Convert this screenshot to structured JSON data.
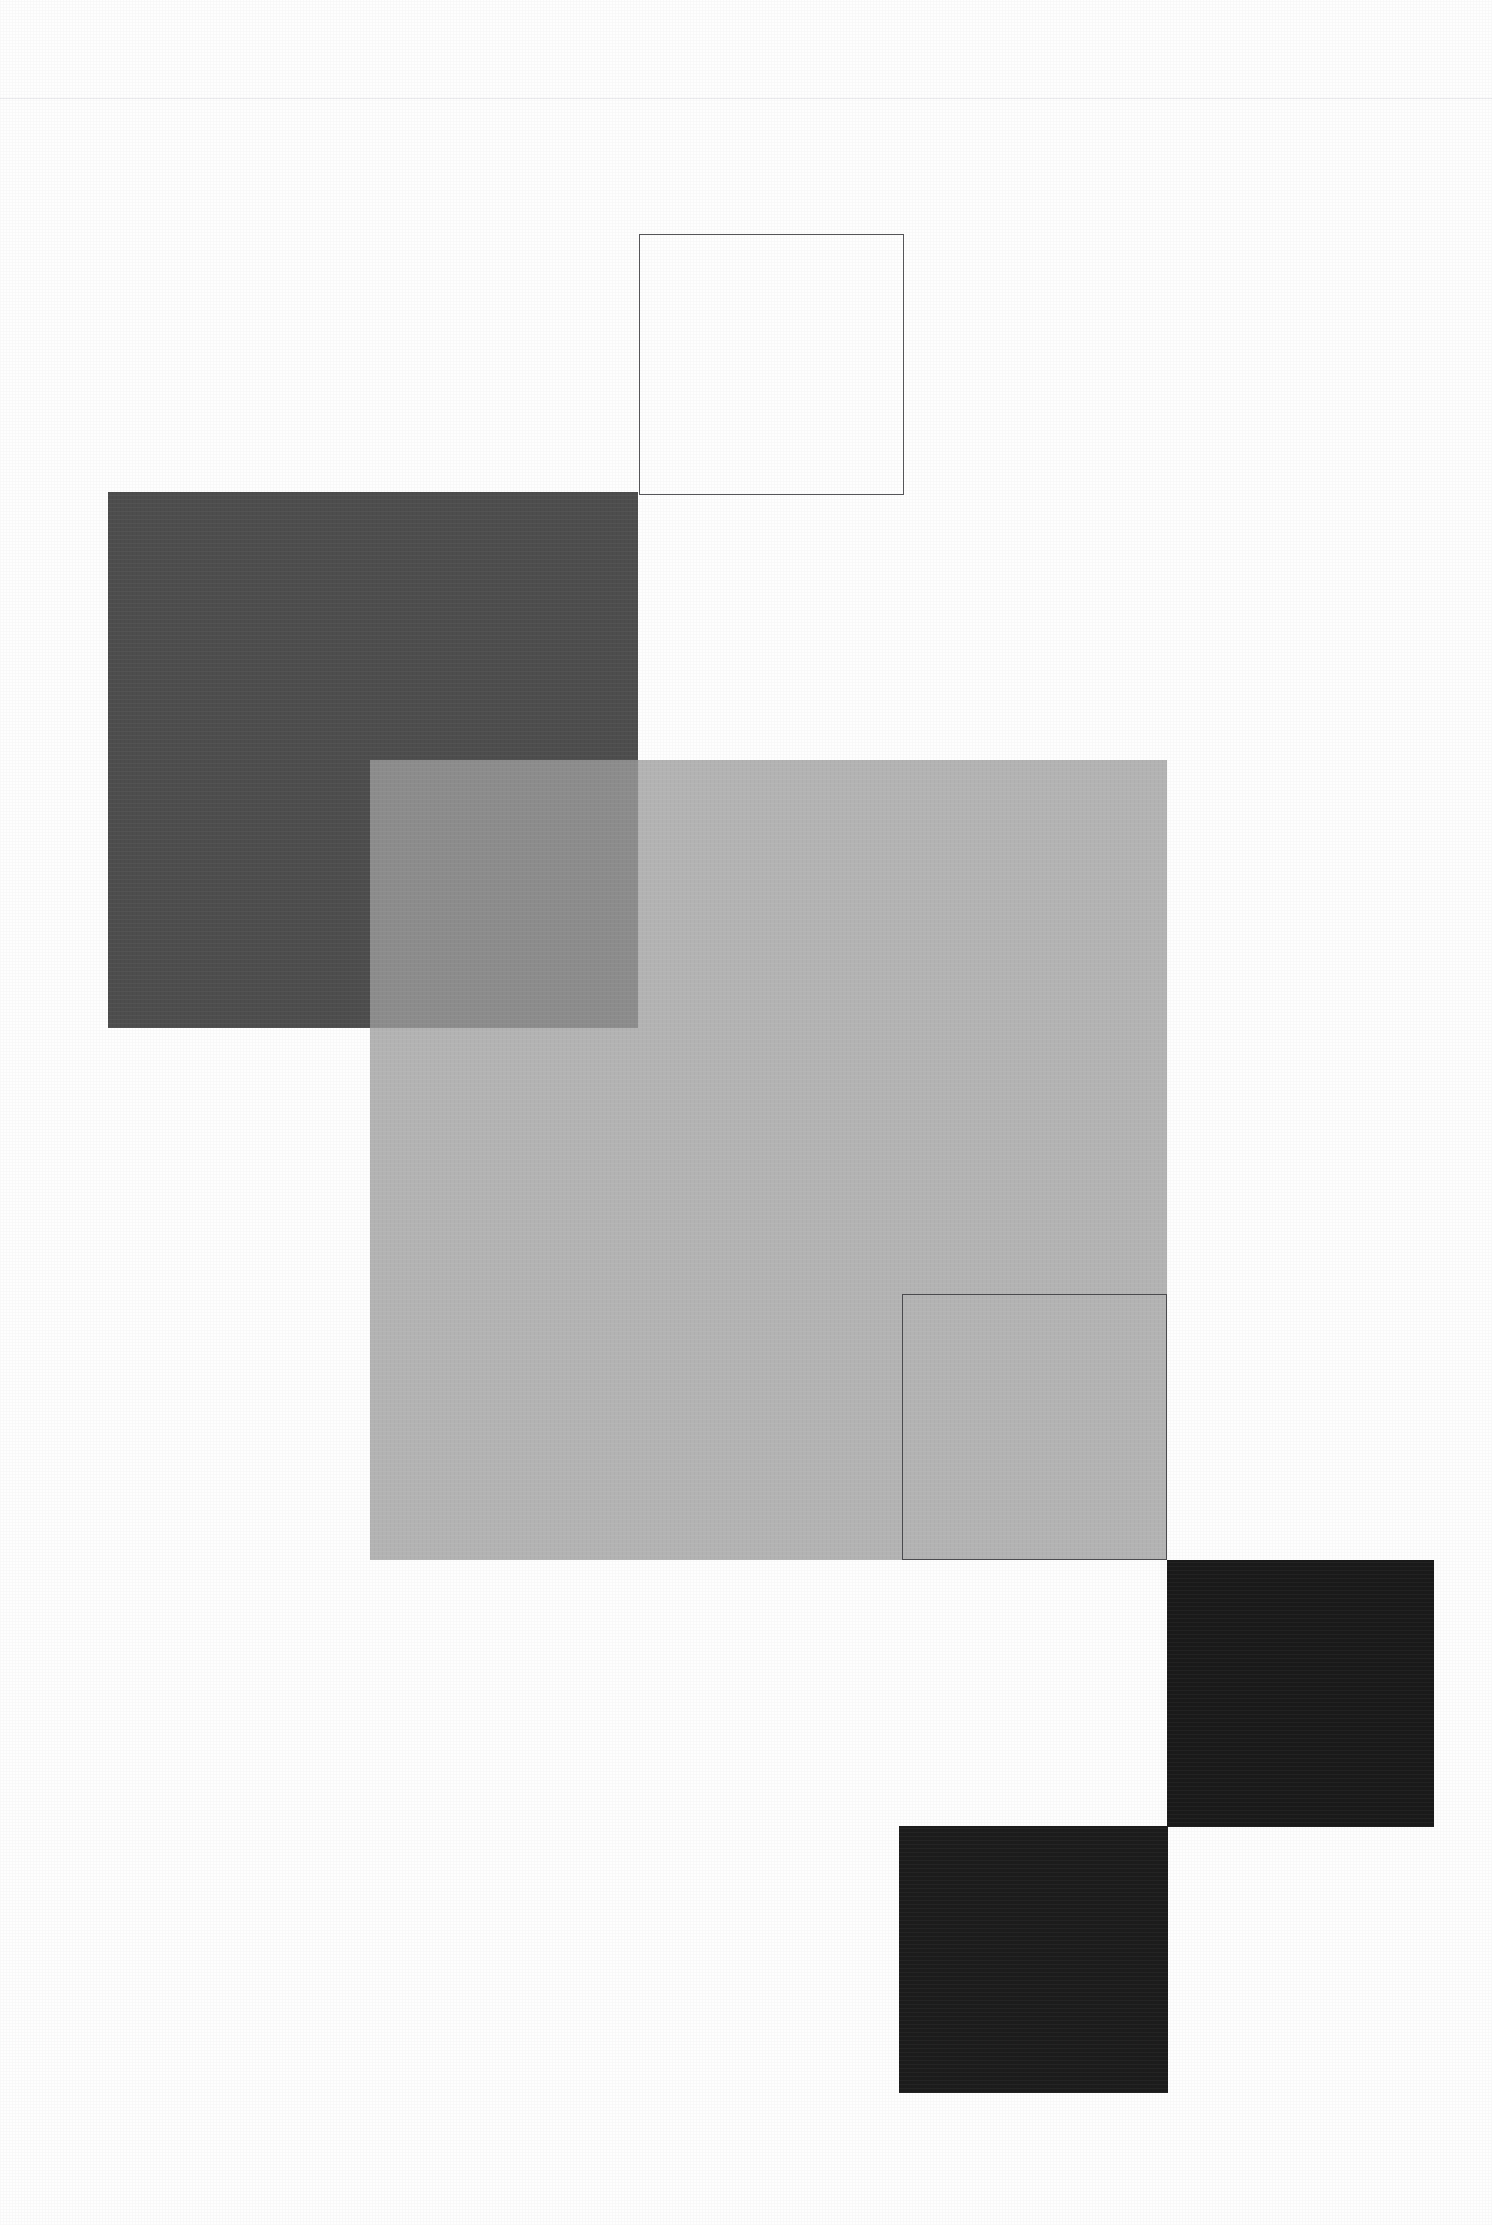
{
  "page": {
    "width": 1492,
    "height": 2225,
    "background_color": "#fefefe"
  },
  "header": {
    "rule_color": "#e9e9ec",
    "rule_y": 98,
    "rule_thickness": 1
  },
  "ghost_text": {
    "line_a": "",
    "line_b": "",
    "line_c": ""
  },
  "palette": {
    "white": "#ffffff",
    "page_background": "#fefefe",
    "outline_stroke": "#555558",
    "dark_gray": "#4d4d4d",
    "mid_gray": "#ababab",
    "overlap_gray": "#8c8c8c",
    "near_black": "#1a1a1a",
    "near_black_alt": "#1c1c1c",
    "rule_gray": "#e9e9ec"
  },
  "shapes": [
    {
      "id": "outline-square-top",
      "name": "Outlined square (upper)",
      "kind": "outlined",
      "x": 639,
      "y": 234,
      "width": 265,
      "height": 261,
      "fill": "transparent",
      "stroke": "#555558",
      "stroke_width": 1,
      "opacity": 1,
      "z": 40
    },
    {
      "id": "dark-gray-square",
      "name": "Dark gray filled square",
      "kind": "filled",
      "x": 108,
      "y": 492,
      "width": 530,
      "height": 536,
      "fill": "#4d4d4d",
      "stroke": "none",
      "stroke_width": 0,
      "opacity": 1,
      "z": 10
    },
    {
      "id": "mid-gray-square",
      "name": "Mid gray translucent square",
      "kind": "filled",
      "x": 370,
      "y": 760,
      "width": 797,
      "height": 800,
      "fill": "#ababab",
      "stroke": "none",
      "stroke_width": 0,
      "opacity": 0.9,
      "z": 20
    },
    {
      "id": "outline-square-bottom",
      "name": "Outlined square (lower)",
      "kind": "outlined",
      "x": 902,
      "y": 1294,
      "width": 265,
      "height": 266,
      "fill": "transparent",
      "stroke": "#4a4a4d",
      "stroke_width": 1,
      "opacity": 1,
      "z": 41
    },
    {
      "id": "black-square-upper",
      "name": "Near-black square (upper right)",
      "kind": "filled",
      "x": 1167,
      "y": 1560,
      "width": 267,
      "height": 267,
      "fill": "#1a1a1a",
      "stroke": "none",
      "stroke_width": 0,
      "opacity": 1,
      "z": 30
    },
    {
      "id": "black-square-lower",
      "name": "Near-black square (lower left)",
      "kind": "filled",
      "x": 899,
      "y": 1826,
      "width": 269,
      "height": 267,
      "fill": "#1c1c1c",
      "stroke": "none",
      "stroke_width": 0,
      "opacity": 1,
      "z": 31
    }
  ],
  "overlaps": [
    {
      "id": "overlap-dark-mid",
      "name": "Overlap of dark gray and mid gray squares",
      "x": 370,
      "y": 760,
      "width": 268,
      "height": 268,
      "fill": "#8c8c8c",
      "z": 25
    }
  ]
}
